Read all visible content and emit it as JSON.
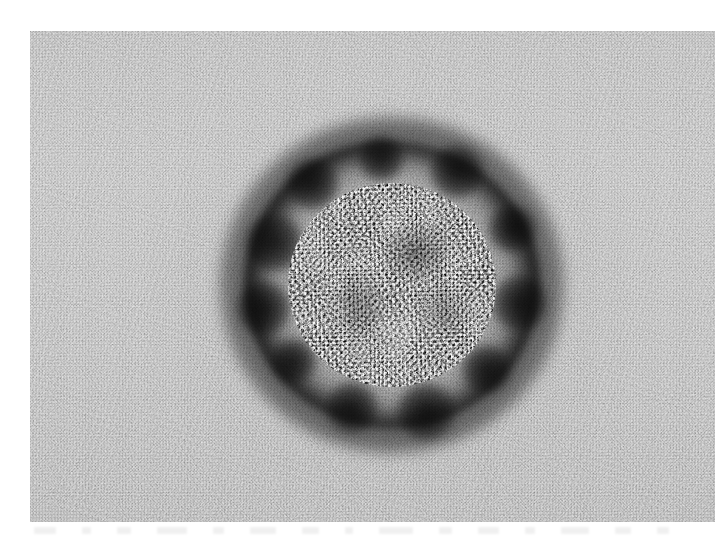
{
  "figure": {
    "kind": "electron-micrograph",
    "modality": "Transmission electron microscopy (TEM), negative stain",
    "subject": "Single enveloped virus particle (coronavirus-like morphology)",
    "caption": "",
    "title": "",
    "orientation": "landscape"
  },
  "canvas": {
    "width": 721,
    "height": 543,
    "page_background": "#ffffff"
  },
  "plate": {
    "left": 30,
    "top": 31,
    "width": 685,
    "height": 491,
    "background_tone": "#bdbdbd",
    "grain": "fine film emulsion grain",
    "margins": {
      "left": 30,
      "top": 31,
      "right": 6,
      "bottom": 21
    }
  },
  "particle": {
    "center_x": 392,
    "center_y": 285,
    "envelope_ring_radius": 116,
    "core_radius": 104,
    "halo_radius": 172,
    "shape": "roughly circular, slightly ovoid",
    "regions": [
      {
        "name": "bright envelope ring",
        "color": "#f8f8f8",
        "description": "Sharp bright rim of unstained viral envelope"
      },
      {
        "name": "granular core interior",
        "color": "#4c4c4c",
        "description": "Mid-grey speckled nucleocapsid interior"
      },
      {
        "name": "dark stain halo",
        "color": "#0c0c0c",
        "description": "Irregular black pooled negative stain forming a knobby corona"
      },
      {
        "name": "background field",
        "color": "#bdbdbd",
        "description": "Light grey grainy support film"
      }
    ]
  },
  "spike_lobes": [
    {
      "angle_deg": 200,
      "size": 58,
      "offset": 124
    },
    {
      "angle_deg": 232,
      "size": 52,
      "offset": 128
    },
    {
      "angle_deg": 265,
      "size": 46,
      "offset": 126
    },
    {
      "angle_deg": 300,
      "size": 54,
      "offset": 130
    },
    {
      "angle_deg": 335,
      "size": 48,
      "offset": 132
    },
    {
      "angle_deg": 8,
      "size": 56,
      "offset": 128
    },
    {
      "angle_deg": 42,
      "size": 50,
      "offset": 126
    },
    {
      "angle_deg": 75,
      "size": 58,
      "offset": 130
    },
    {
      "angle_deg": 108,
      "size": 52,
      "offset": 128
    },
    {
      "angle_deg": 142,
      "size": 46,
      "offset": 124
    },
    {
      "angle_deg": 170,
      "size": 54,
      "offset": 130
    }
  ],
  "bottom_marks": [
    {
      "width": 22
    },
    {
      "width": 9
    },
    {
      "width": 14
    },
    {
      "width": 30
    },
    {
      "width": 11
    },
    {
      "width": 26
    },
    {
      "width": 17
    },
    {
      "width": 8
    },
    {
      "width": 34
    },
    {
      "width": 13
    },
    {
      "width": 21
    },
    {
      "width": 10
    },
    {
      "width": 28
    },
    {
      "width": 16
    },
    {
      "width": 12
    }
  ],
  "scale_bar": null,
  "annotations": [],
  "labels": []
}
